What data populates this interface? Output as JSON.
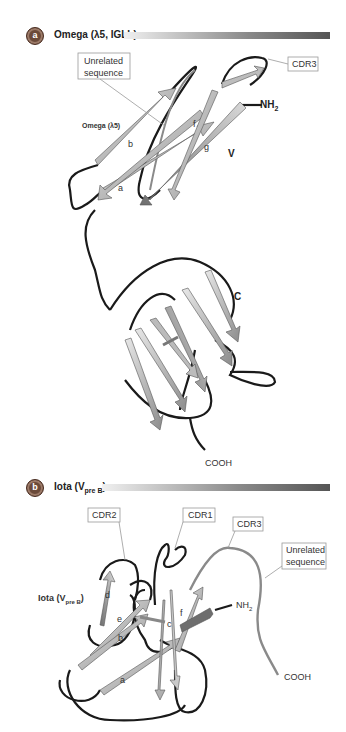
{
  "panel_a": {
    "badge": "a",
    "title": "Omega (λ5, IGLL)",
    "labels": {
      "unrelated_sequence_line1": "Unrelated",
      "unrelated_sequence_line2": "sequence",
      "cdr3": "CDR3",
      "nh2": "NH",
      "nh2_sub": "2",
      "domain_name": "Omega (λ5)",
      "v_domain": "V",
      "c_domain": "C",
      "cooh": "COOH",
      "strands": [
        "b",
        "a",
        "f",
        "g"
      ]
    }
  },
  "panel_b": {
    "badge": "b",
    "title": "Iota (V",
    "title_sub": "pre B",
    "title_close": ")",
    "labels": {
      "cdr1": "CDR1",
      "cdr2": "CDR2",
      "cdr3": "CDR3",
      "unrelated_sequence_line1": "Unrelated",
      "unrelated_sequence_line2": "sequence",
      "domain_name": "Iota (V",
      "domain_sub": "pre B",
      "domain_close": ")",
      "nh2": "NH",
      "nh2_sub": "2",
      "cooh": "COOH",
      "strands": [
        "d",
        "e",
        "b",
        "c",
        "f",
        "a"
      ]
    }
  },
  "colors": {
    "badge": "#6b4a3a",
    "loop": "#1a1a1a",
    "unrelated_loop": "#8a8a8a",
    "strand_light": "#cfcfcf",
    "strand_dark": "#7a7a7a"
  }
}
